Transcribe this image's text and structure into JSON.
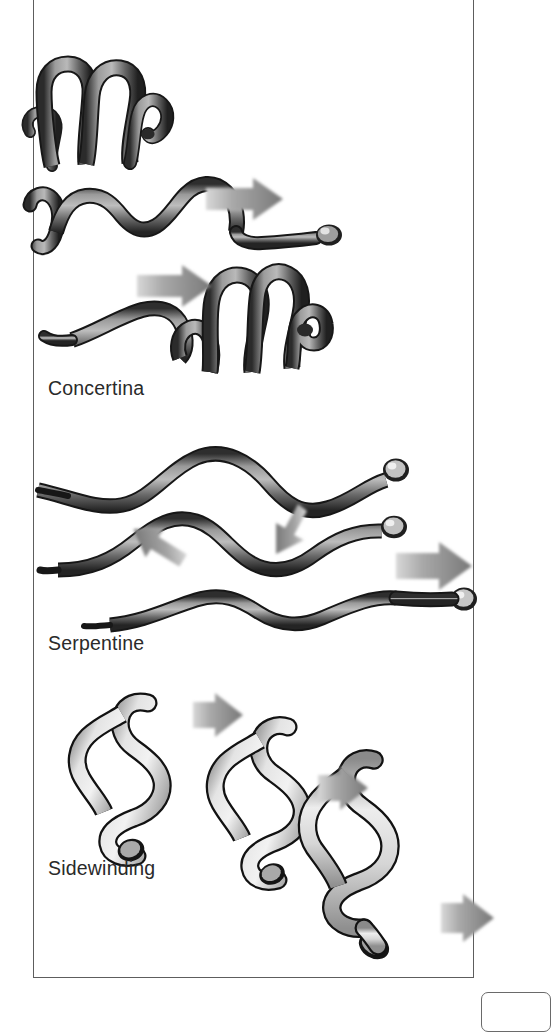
{
  "figure": {
    "top_caption_partial": "",
    "panel": {
      "frame_color": "#5d5d5d",
      "background": "#ffffff"
    },
    "labels": {
      "concertina": "Concertina",
      "serpentine": "Serpentine",
      "sidewinding": "Sidewinding"
    },
    "colors": {
      "snake_dark_outline": "#1b1b1b",
      "snake_dark_body": "#6e6e6e",
      "snake_dark_shade": "#3a3a3a",
      "snake_light_body": "#d8d8d8",
      "snake_light_shade": "#9a9a9a",
      "arrow_gray": "#8f8f8f",
      "arrow_gray_dark": "#6e6e6e",
      "frame": "#5d5d5d",
      "label_text": "#2a2a2a"
    },
    "sections": [
      {
        "id": "concertina",
        "label": "Concertina",
        "snake_count": 3,
        "arrow_count": 2,
        "arrow_direction": "right",
        "tone": "dark"
      },
      {
        "id": "serpentine",
        "label": "Serpentine",
        "snake_count": 3,
        "arrow_count": 3,
        "arrow_direction": "two-left-diagonal-one-right",
        "tone": "dark"
      },
      {
        "id": "sidewinding",
        "label": "Sidewinding",
        "snake_count": 3,
        "arrow_count": 3,
        "arrow_direction": "right",
        "tone": "light"
      }
    ]
  }
}
